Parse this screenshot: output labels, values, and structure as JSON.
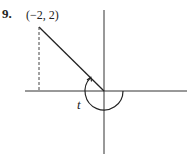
{
  "problem": {
    "number": "9.",
    "point_label": "(−2, 2)",
    "angle_label": "t"
  },
  "figure": {
    "point": {
      "x": -2,
      "y": 2
    },
    "angle_arc": "from positive x-axis counterclockwise to terminal side through (−2, 2)",
    "projection": "dashed vertical segment from point to x-axis"
  }
}
